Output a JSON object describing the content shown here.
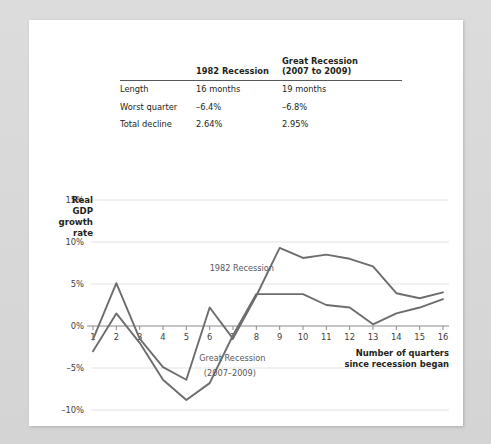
{
  "table": {
    "headers": [
      "",
      "1982 Recession",
      "Great Recession",
      "(2007 to 2009)"
    ],
    "col1_header": "1982 Recession",
    "col2_header_line1": "Great Recession",
    "col2_header_line2": "(2007 to 2009)",
    "rows": [
      {
        "label": "Length",
        "v1": "16 months",
        "v2": "19 months"
      },
      {
        "label": "Worst quarter",
        "v1": "–6.4%",
        "v2": "–6.8%"
      },
      {
        "label": "Total decline",
        "v1": "2.64%",
        "v2": "2.95%"
      }
    ]
  },
  "chart_data": {
    "type": "line",
    "title": "",
    "xlabel": "Number of quarters since recession began",
    "ylabel": "Real GDP growth rate",
    "xlim": [
      0.5,
      16.5
    ],
    "ylim": [
      -11.5,
      16
    ],
    "grid": true,
    "legend": "annotations",
    "x": [
      1,
      2,
      3,
      4,
      5,
      6,
      7,
      8,
      9,
      10,
      11,
      12,
      13,
      14,
      15,
      16
    ],
    "xticklabels": [
      "1",
      "2",
      "3",
      "4",
      "5",
      "6",
      "7",
      "8",
      "9",
      "10",
      "11",
      "12",
      "13",
      "14",
      "15",
      "16"
    ],
    "yticks": [
      -10,
      -5,
      0,
      5,
      10,
      15
    ],
    "yticklabels": [
      "–10%",
      "–5%",
      "0%",
      "5%",
      "10%",
      "15%"
    ],
    "series": [
      {
        "name": "1982 Recession",
        "color": "#6d6d6d",
        "values": [
          -1.6,
          5.1,
          -1.5,
          -4.9,
          -6.4,
          2.2,
          -1.5,
          3.6,
          9.3,
          8.1,
          8.5,
          8.0,
          7.1,
          3.9,
          3.3,
          4.0
        ]
      },
      {
        "name": "Great Recession (2007–2009)",
        "color": "#6d6d6d",
        "values": [
          -3.0,
          1.5,
          -2.0,
          -6.4,
          -8.8,
          -6.8,
          -1.1,
          3.8,
          3.8,
          3.8,
          2.5,
          2.2,
          0.2,
          1.5,
          2.2,
          3.2
        ]
      }
    ],
    "annotations": [
      {
        "text": "1982 Recession",
        "x": 6.0,
        "y": 6.6,
        "align": "start",
        "bold": false
      },
      {
        "text": "Great Recession",
        "x": 5.55,
        "y": -4.2,
        "align": "start",
        "bold": false
      },
      {
        "text": "(2007–2009)",
        "x": 5.75,
        "y": -5.9,
        "align": "start",
        "bold": false
      }
    ],
    "axis_title_lines": [
      "Number of quarters",
      "since recession began"
    ],
    "ytitle_lines": [
      "Real",
      "GDP",
      "growth",
      "rate"
    ]
  }
}
